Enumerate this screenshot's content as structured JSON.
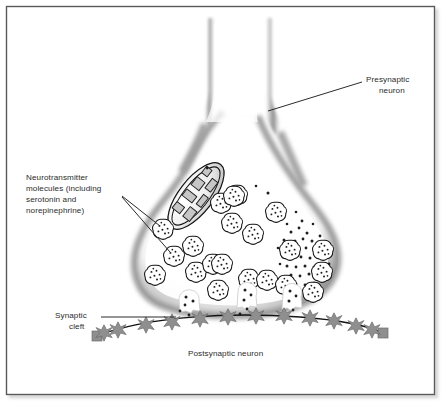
{
  "figure": {
    "kind": "biology-diagram",
    "background_color": "#ffffff",
    "frame": {
      "border_color": "#5a5a5a",
      "shadow_color": "#b9b9b9"
    },
    "labels": {
      "presynaptic": {
        "line1": "Presynaptic",
        "line2": "neuron"
      },
      "neurotransmitter": {
        "line1": "Neurotransmitter",
        "line2": "molecules (including",
        "line3": "serotonin and",
        "line4": "norepinephrine)"
      },
      "synaptic_cleft": {
        "line1": "Synaptic",
        "line2": "cleft"
      },
      "postsynaptic": {
        "line1": "Postsynaptic neuron"
      }
    },
    "parts": {
      "axon_terminal_name": "axon-terminal-bouton",
      "mitochondrion_name": "mitochondrion",
      "vesicle_name": "synaptic-vesicle",
      "receptor_name": "postsynaptic-receptor",
      "transmitter_dot_name": "neurotransmitter-molecule"
    },
    "colors": {
      "membrane_shading": "#8d8d8d",
      "receptor_fill": "#8f8f8f",
      "receptor_stroke": "#6e6e6e",
      "outline": "#1a1a1a",
      "leader_line": "#2b2b2b",
      "text": "#2b2b2b"
    },
    "counts": {
      "vesicles_in_terminal": 21,
      "vesicles_fusing": 3,
      "receptors": 12
    }
  }
}
